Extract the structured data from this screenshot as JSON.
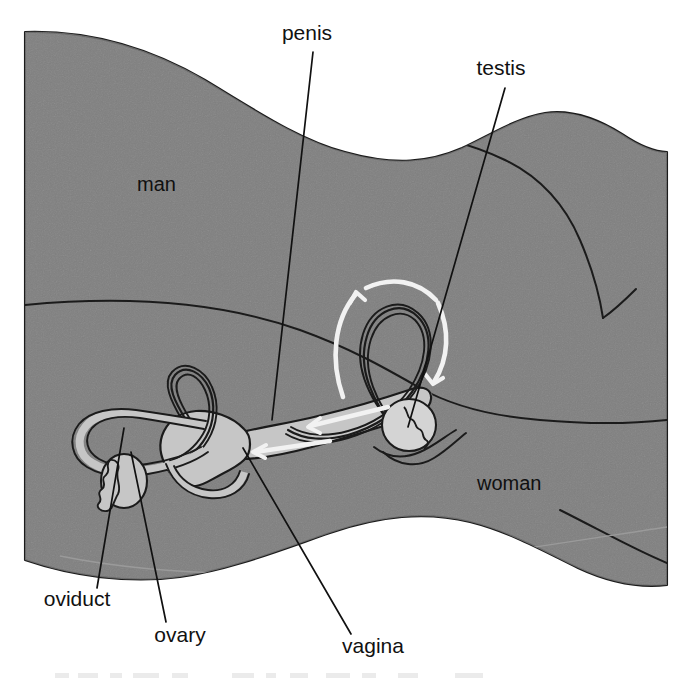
{
  "figure": {
    "width": 692,
    "height": 682,
    "background_color": "#ffffff"
  },
  "colors": {
    "body_fill": "#808080",
    "organ_fill": "#c6c6c6",
    "organ_fill_light": "#d4d4d4",
    "outline": "#1b1b1b",
    "label_text": "#111111",
    "flow_arrow": "#f2f2f2",
    "faint_caption": "#d9d9d9"
  },
  "labels": {
    "outside": [
      {
        "id": "penis",
        "text": "penis",
        "x": 307,
        "y": 40,
        "anchor": "middle"
      },
      {
        "id": "testis",
        "text": "testis",
        "x": 501,
        "y": 75,
        "anchor": "middle"
      },
      {
        "id": "oviduct",
        "text": "oviduct",
        "x": 77,
        "y": 606,
        "anchor": "middle"
      },
      {
        "id": "ovary",
        "text": "ovary",
        "x": 180,
        "y": 642,
        "anchor": "middle"
      },
      {
        "id": "vagina",
        "text": "vagina",
        "x": 373,
        "y": 653,
        "anchor": "middle"
      }
    ],
    "inside": [
      {
        "id": "man",
        "text": "man",
        "x": 137,
        "y": 191,
        "anchor": "start"
      },
      {
        "id": "woman",
        "text": "woman",
        "x": 477,
        "y": 490,
        "anchor": "start"
      }
    ]
  },
  "leader_lines": [
    {
      "id": "penis-leader",
      "from_label": "penis",
      "x1": 313,
      "y1": 52,
      "x2": 272,
      "y2": 420
    },
    {
      "id": "testis-leader",
      "from_label": "testis",
      "x1": 505,
      "y1": 88,
      "x2": 408,
      "y2": 425
    },
    {
      "id": "oviduct-leader",
      "from_label": "oviduct",
      "x1": 97,
      "y1": 588,
      "x2": 124,
      "y2": 428
    },
    {
      "id": "ovary-leader",
      "from_label": "ovary",
      "x1": 166,
      "y1": 622,
      "x2": 131,
      "y2": 452
    },
    {
      "id": "vagina-leader",
      "from_label": "vagina",
      "x1": 351,
      "y1": 634,
      "x2": 243,
      "y2": 448
    }
  ],
  "organs": {
    "man_parts": [
      "penis",
      "testis"
    ],
    "woman_parts": [
      "oviduct",
      "ovary",
      "vagina"
    ],
    "flow_direction": "toward-vagina",
    "rotation_arrow": "counterclockwise-around-testis"
  },
  "faint_caption": {
    "visible": true,
    "text": ""
  }
}
